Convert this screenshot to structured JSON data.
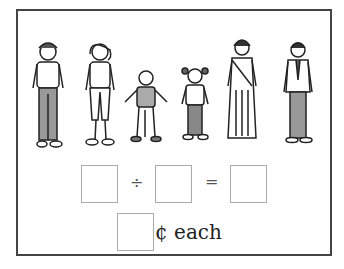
{
  "illustration": {
    "description": "family of six people: man, woman, boy, girl, woman in sari, man in suit",
    "people": [
      "man",
      "woman",
      "boy",
      "girl",
      "woman-in-sari",
      "man-in-suit"
    ]
  },
  "equation": {
    "operator_divide": "÷",
    "operator_equals": "=",
    "box1_value": "",
    "box2_value": "",
    "box3_value": ""
  },
  "answer": {
    "box_value": "",
    "unit_label": "¢ each"
  }
}
